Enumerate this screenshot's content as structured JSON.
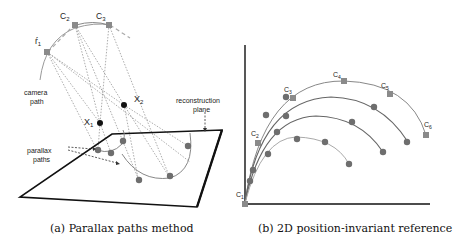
{
  "figure_a": {
    "caption": "(a) Parallax paths method",
    "labels": {
      "camera_path": [
        "camera",
        "path"
      ],
      "reconstruction_plane": [
        "reconstruction",
        "plane"
      ],
      "parallax_paths": [
        "parallax",
        "paths"
      ],
      "cameras": [
        "C1",
        "C2",
        "C3"
      ],
      "points": [
        "X1",
        "X2"
      ]
    }
  },
  "figure_b": {
    "caption": "(b) 2D position-invariant reference",
    "labels": {
      "cameras": [
        "C1",
        "C2",
        "C3",
        "C4",
        "C5",
        "C6"
      ]
    }
  },
  "colors": {
    "camera_marker": "#8a8a8a",
    "path_point": "#6e6e6e",
    "point_black": "#111111",
    "curve": "#888888",
    "plane_edge": "#111111"
  }
}
